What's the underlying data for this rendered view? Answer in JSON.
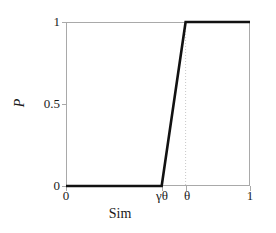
{
  "chart_data": {
    "type": "line",
    "title": "",
    "subtitle": "",
    "xlabel": "Sim",
    "ylabel": "P",
    "xlim": [
      0,
      1
    ],
    "ylim": [
      0,
      1
    ],
    "grid": false,
    "legend": null,
    "legend_position": "none",
    "x_ticks": [
      {
        "value": 0,
        "label": "0"
      },
      {
        "value": 0.52,
        "label": "γθ"
      },
      {
        "value": 0.65,
        "label": "θ"
      },
      {
        "value": 1,
        "label": "1"
      }
    ],
    "y_ticks": [
      {
        "value": 0,
        "label": "0"
      },
      {
        "value": 0.5,
        "label": "0.5"
      },
      {
        "value": 1,
        "label": "1"
      }
    ],
    "series": [
      {
        "name": "P(Sim)",
        "color": "#111111",
        "linewidth": 2.6,
        "points": [
          {
            "x": 0,
            "y": 0
          },
          {
            "x": 0.52,
            "y": 0
          },
          {
            "x": 0.65,
            "y": 1
          },
          {
            "x": 1,
            "y": 1
          }
        ]
      }
    ],
    "annotations": [
      {
        "type": "vertical-dotted-guide",
        "at_x": 0.65,
        "label": "θ",
        "color": "#c8c8c8"
      }
    ]
  },
  "axes": {
    "frame_color": "#a9a9a9",
    "tick_color": "#a9a9a9",
    "text_color": "#1a1a1a",
    "background": "#ffffff"
  }
}
